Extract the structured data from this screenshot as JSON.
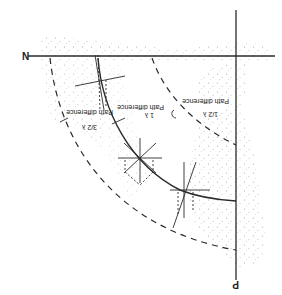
{
  "diagram": {
    "orientation": "rotated-180",
    "colors": {
      "ink": "#2a2a2a",
      "stipple": "#9a9a9a",
      "background": "#ffffff"
    },
    "axes": {
      "horizontal_label": "N",
      "vertical_label": "P"
    },
    "labels": {
      "path_half": {
        "text": "Path difference",
        "fraction": "1/2 λ"
      },
      "path_one": {
        "text": "Path difference",
        "fraction": "1 λ"
      },
      "path_three_half": {
        "text": "Path difference",
        "fraction": "3/2 λ"
      }
    }
  }
}
